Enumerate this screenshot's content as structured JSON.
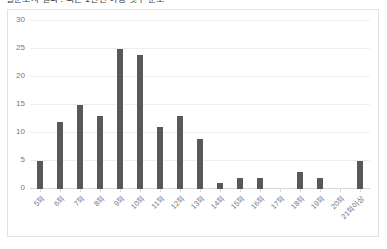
{
  "figure": {
    "title_clipped": "설문조사 결과 : 최근 1년간 이용 횟수 분포"
  },
  "chart_data": {
    "type": "bar",
    "title": "",
    "xlabel": "",
    "ylabel": "",
    "categories": [
      "5회",
      "6회",
      "7회",
      "8회",
      "9회",
      "10회",
      "11회",
      "12회",
      "13회",
      "14회",
      "15회",
      "16회",
      "17회",
      "18회",
      "19회",
      "20회",
      "21회이상"
    ],
    "values": [
      5,
      12,
      15,
      13,
      25,
      24,
      11,
      13,
      9,
      1,
      2,
      2,
      0,
      3,
      2,
      0,
      5
    ],
    "ylim": [
      0,
      30
    ],
    "yticks": [
      0,
      5,
      10,
      15,
      20,
      25,
      30
    ],
    "grid": true,
    "legend": "none",
    "bar_color": "#595959",
    "gridline_color": "#efefef",
    "plot_border_color": "#e2e2e2"
  }
}
